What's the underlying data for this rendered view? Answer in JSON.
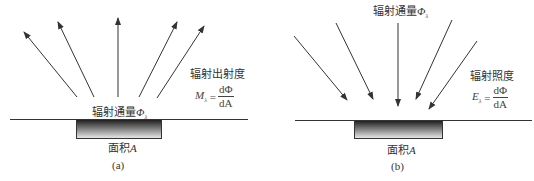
{
  "panels": [
    {
      "id": "a",
      "caption": "(a)",
      "direction": "outgoing",
      "flux_label": "辐射通量",
      "flux_symbol": "Φ",
      "flux_sub": "λ",
      "quantity_name": "辐射出射度",
      "formula": {
        "lhs": "M",
        "lhs_sub": "λ",
        "eq": "=",
        "numerator": "dΦ",
        "denominator": "dA"
      },
      "area_label": "面积",
      "area_symbol": "A",
      "arrow_count": 5
    },
    {
      "id": "b",
      "caption": "(b)",
      "direction": "incoming",
      "flux_label": "辐射通量",
      "flux_symbol": "Φ",
      "flux_sub": "λ",
      "quantity_name": "辐射照度",
      "formula": {
        "lhs": "E",
        "lhs_sub": "λ",
        "eq": "=",
        "numerator": "dΦ",
        "denominator": "dA"
      },
      "area_label": "面积",
      "area_symbol": "A",
      "arrow_count": 5
    }
  ],
  "colors": {
    "line": "#333333",
    "gradient_top": "#1a1a1a",
    "gradient_bottom": "#e8e8e8"
  }
}
